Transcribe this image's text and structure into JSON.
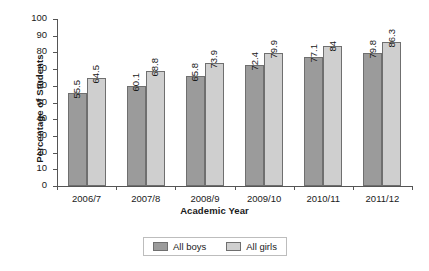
{
  "chart_data": {
    "type": "bar",
    "title": "",
    "xlabel": "Academic Year",
    "ylabel": "Percentage of Students",
    "categories": [
      "2006/7",
      "2007/8",
      "2008/9",
      "2009/10",
      "2010/11",
      "2011/12"
    ],
    "series": [
      {
        "name": "All boys",
        "color": "#9b9b9b",
        "values": [
          55.5,
          60.1,
          65.8,
          72.4,
          77.1,
          79.8
        ],
        "labels": [
          "55.5",
          "60.1",
          "65.8",
          "72.4",
          "77.1",
          "79.8"
        ]
      },
      {
        "name": "All girls",
        "color": "#cfcfcf",
        "values": [
          64.5,
          68.8,
          73.9,
          79.9,
          84,
          86.3
        ],
        "labels": [
          "64.5",
          "68.8",
          "73.9",
          "79.9",
          "84",
          "86.3"
        ]
      }
    ],
    "ylim": [
      0,
      100
    ],
    "yticks": [
      0,
      10,
      20,
      30,
      40,
      50,
      60,
      70,
      80,
      90,
      100
    ],
    "ytick_labels": [
      "0",
      "10",
      "20",
      "30",
      "40",
      "50",
      "60",
      "70",
      "80",
      "90",
      "100"
    ],
    "grid": false,
    "legend_position": "bottom-center",
    "legend_entries": [
      "All boys",
      "All girls"
    ]
  }
}
